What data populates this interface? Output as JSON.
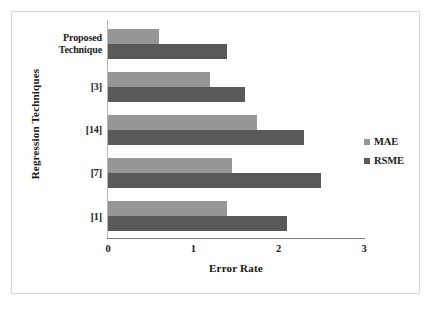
{
  "chart_data": {
    "type": "bar",
    "orientation": "horizontal",
    "title": "",
    "xlabel": "Error Rate",
    "ylabel": "Regression Techniques",
    "categories": [
      "Proposed Technique",
      "[3]",
      "[14]",
      "[7]",
      "[1]"
    ],
    "series": [
      {
        "name": "MAE",
        "color": "#969696",
        "values": [
          0.6,
          1.2,
          1.75,
          1.45,
          1.4
        ]
      },
      {
        "name": "RSME",
        "color": "#595959",
        "values": [
          1.4,
          1.6,
          2.3,
          2.5,
          2.1
        ]
      }
    ],
    "xlim": [
      0,
      3
    ],
    "xticks": [
      "0",
      "1",
      "2",
      "3"
    ],
    "xtick_values": [
      0,
      1,
      2,
      3
    ],
    "grid": false,
    "legend_position": "right"
  },
  "legend": {
    "items": [
      {
        "label": "MAE",
        "color": "#969696"
      },
      {
        "label": "RSME",
        "color": "#595959"
      }
    ]
  },
  "axes": {
    "x_title": "Error Rate",
    "y_title": "Regression Techniques"
  }
}
